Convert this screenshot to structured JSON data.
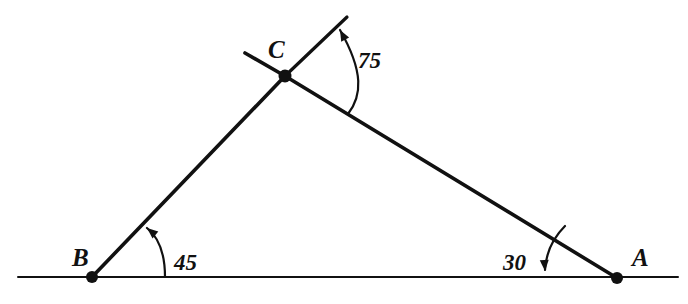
{
  "diagram": {
    "type": "geometry-triangle-with-exterior-angles",
    "background_color": "#ffffff",
    "stroke_color": "#111111",
    "vertices": [
      {
        "id": "A",
        "label": "A",
        "x": 617,
        "y": 278,
        "label_x": 632,
        "label_y": 266
      },
      {
        "id": "B",
        "label": "B",
        "x": 92,
        "y": 277,
        "label_x": 72,
        "label_y": 266
      },
      {
        "id": "C",
        "label": "C",
        "x": 285,
        "y": 76,
        "label_x": 268,
        "label_y": 58
      }
    ],
    "angles": [
      {
        "at": "B",
        "label": "45",
        "label_x": 174,
        "label_y": 270
      },
      {
        "at": "C",
        "label": "75",
        "label_x": 358,
        "label_y": 68
      },
      {
        "at": "A",
        "label": "30",
        "label_x": 503,
        "label_y": 270
      }
    ],
    "baseline": {
      "x1": 18,
      "y1": 277,
      "x2": 678,
      "y2": 277,
      "width": 2
    },
    "segments": [
      {
        "name": "side-BC",
        "x1": 92,
        "y1": 277,
        "x2": 285,
        "y2": 76,
        "width": 3.6
      },
      {
        "name": "side-CA",
        "x1": 285,
        "y1": 76,
        "x2": 617,
        "y2": 278,
        "width": 3.6
      },
      {
        "name": "extension-beyond-C",
        "x1": 285,
        "y1": 76,
        "x2": 245,
        "y2": 53,
        "width": 3.6
      }
    ],
    "ray": {
      "name": "ray-from-C",
      "x1": 285,
      "y1": 76,
      "x2": 347,
      "y2": 17,
      "width": 3.2
    },
    "arcs": [
      {
        "name": "arc-45-at-B",
        "d": "M 165 277 C 165 252, 157 236, 147 228",
        "width": 2.2
      },
      {
        "name": "arc-75-at-C",
        "d": "M 348 114 C 362 96, 364 72, 340 30",
        "width": 2.2
      },
      {
        "name": "arc-30-at-A",
        "d": "M 565 226 C 553 238, 546 252, 545 270",
        "width": 2.2
      }
    ],
    "arrowheads": [
      {
        "name": "arrowhead-45-at-B",
        "x": 147,
        "y": 228,
        "angle": -140
      },
      {
        "name": "arrowhead-75-at-C",
        "x": 340,
        "y": 30,
        "angle": -118
      },
      {
        "name": "arrowhead-30-at-A",
        "x": 545,
        "y": 271,
        "angle": 86
      }
    ],
    "dot_radius": 6
  }
}
